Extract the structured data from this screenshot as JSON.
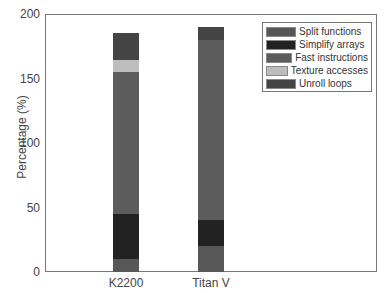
{
  "chart_data": {
    "type": "bar",
    "stacked": true,
    "title": "",
    "xlabel": "",
    "ylabel": "Percentage (%)",
    "ylim": [
      0,
      200
    ],
    "yticks": [
      0,
      50,
      100,
      150,
      200
    ],
    "grid": false,
    "legend_position": "upper right",
    "categories": [
      "K2200",
      "Titan V"
    ],
    "series": [
      {
        "name": "Split functions",
        "color": "#575757",
        "values": [
          10,
          20
        ]
      },
      {
        "name": "Simplify arrays",
        "color": "#222222",
        "values": [
          35,
          20
        ]
      },
      {
        "name": "Fast instructions",
        "color": "#5c5c5c",
        "values": [
          110,
          140
        ]
      },
      {
        "name": "Texture accesses",
        "color": "#bdbdbd",
        "values": [
          9,
          0
        ]
      },
      {
        "name": "Unroll loops",
        "color": "#444444",
        "values": [
          21,
          10
        ]
      }
    ]
  }
}
